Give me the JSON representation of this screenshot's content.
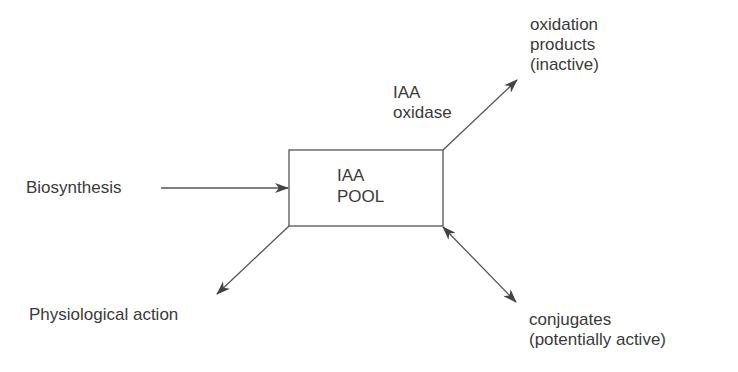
{
  "diagram": {
    "type": "flow",
    "center_node": {
      "id": "iaa_pool",
      "lines": [
        "IAA",
        "POOL"
      ]
    },
    "nodes": [
      {
        "id": "biosynthesis",
        "label": "Biosynthesis"
      },
      {
        "id": "oxidation_products",
        "lines": [
          "oxidation",
          "products",
          "(inactive)"
        ]
      },
      {
        "id": "physiological_action",
        "label": "Physiological action"
      },
      {
        "id": "conjugates",
        "lines": [
          "conjugates",
          "(potentially active)"
        ]
      }
    ],
    "edge_labels": {
      "oxidase": [
        "IAA",
        "oxidase"
      ]
    },
    "edges": [
      {
        "from": "biosynthesis",
        "to": "iaa_pool",
        "direction": "forward"
      },
      {
        "from": "iaa_pool",
        "to": "oxidation_products",
        "direction": "forward",
        "label": "IAA oxidase"
      },
      {
        "from": "iaa_pool",
        "to": "physiological_action",
        "direction": "forward"
      },
      {
        "from": "iaa_pool",
        "to": "conjugates",
        "direction": "bidirectional"
      }
    ],
    "colors": {
      "line": "#555555",
      "text": "#3a3a3a",
      "background": "#ffffff"
    }
  }
}
